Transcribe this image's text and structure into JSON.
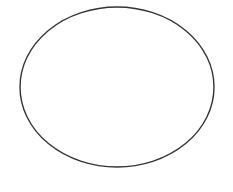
{
  "canvas": {
    "width": 233,
    "height": 192,
    "background": "#ffffff"
  },
  "shapes": [
    {
      "type": "ellipse",
      "name": "ellipse-outline",
      "cx": 117,
      "cy": 87,
      "rx": 97,
      "ry": 80,
      "stroke": "#333333",
      "stroke_width": 1.4,
      "fill": "none"
    }
  ]
}
